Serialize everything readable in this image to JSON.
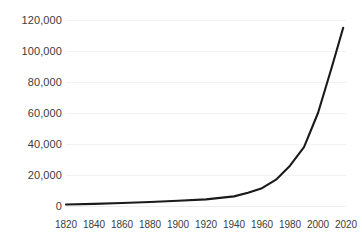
{
  "chart_data": {
    "type": "line",
    "title": "",
    "subtitle": "",
    "xlabel": "",
    "ylabel": "",
    "grid": true,
    "legend": false,
    "legend_position": "none",
    "series_color": "#1a1a1a",
    "background_color": "#ffffff",
    "gridline_color": "#f2f2f2",
    "label_color": "#3c3c3c",
    "xlim": [
      1820,
      2020
    ],
    "ylim": [
      0,
      120000
    ],
    "x_ticks": [
      "1820",
      "1840",
      "1860",
      "1880",
      "1900",
      "1920",
      "1940",
      "1960",
      "1980",
      "2000",
      "2020"
    ],
    "x_tick_values": [
      1820,
      1840,
      1860,
      1880,
      1900,
      1920,
      1940,
      1960,
      1980,
      2000,
      2020
    ],
    "y_ticks": [
      "0",
      "20,000",
      "40,000",
      "60,000",
      "80,000",
      "100,000",
      "120,000"
    ],
    "y_tick_values": [
      0,
      20000,
      40000,
      60000,
      80000,
      100000,
      120000
    ],
    "series": [
      {
        "name": "value",
        "x": [
          1820,
          1840,
          1860,
          1880,
          1900,
          1920,
          1940,
          1950,
          1960,
          1970,
          1980,
          1990,
          2000,
          2010,
          2018
        ],
        "values": [
          1000,
          1400,
          1900,
          2600,
          3400,
          4300,
          6200,
          8500,
          11500,
          17000,
          26000,
          38000,
          60000,
          90000,
          115000
        ]
      }
    ]
  }
}
